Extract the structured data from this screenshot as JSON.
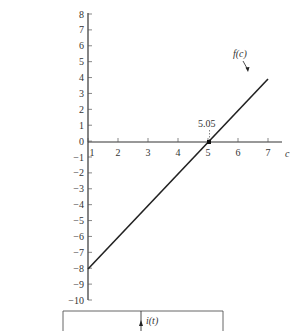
{
  "chart_data": {
    "type": "line",
    "title": "",
    "xlabel": "c",
    "ylabel": "",
    "xlim": [
      1,
      7.4
    ],
    "ylim": [
      -10,
      8
    ],
    "x_ticks": [
      1,
      2,
      3,
      4,
      5,
      6,
      7
    ],
    "y_ticks": [
      8,
      7,
      6,
      5,
      4,
      3,
      2,
      1,
      0,
      -1,
      -2,
      -3,
      -4,
      -5,
      -6,
      -7,
      -8,
      -9,
      -10
    ],
    "grid": false,
    "series": [
      {
        "name": "f(c)",
        "x": [
          1,
          7
        ],
        "values": [
          -8,
          4
        ]
      }
    ],
    "annotations": [
      {
        "text": "f(c)",
        "type": "curve-label",
        "points_to": [
          6.3,
          2.6
        ]
      },
      {
        "text": "5.05",
        "type": "root-marker",
        "x": 5.05,
        "y": 0
      }
    ]
  },
  "labels": {
    "curve": "f(c)",
    "root": "5.05",
    "x_axis": "c",
    "lower_panel_current": "i(t)"
  },
  "x_tick_labels": [
    "1",
    "2",
    "3",
    "4",
    "5",
    "6",
    "7"
  ],
  "y_tick_labels": [
    "8",
    "7",
    "6",
    "5",
    "4",
    "3",
    "2",
    "1",
    "0",
    "−1",
    "−2",
    "−3",
    "−4",
    "−5",
    "−6",
    "−7",
    "−8",
    "−9",
    "−10"
  ]
}
